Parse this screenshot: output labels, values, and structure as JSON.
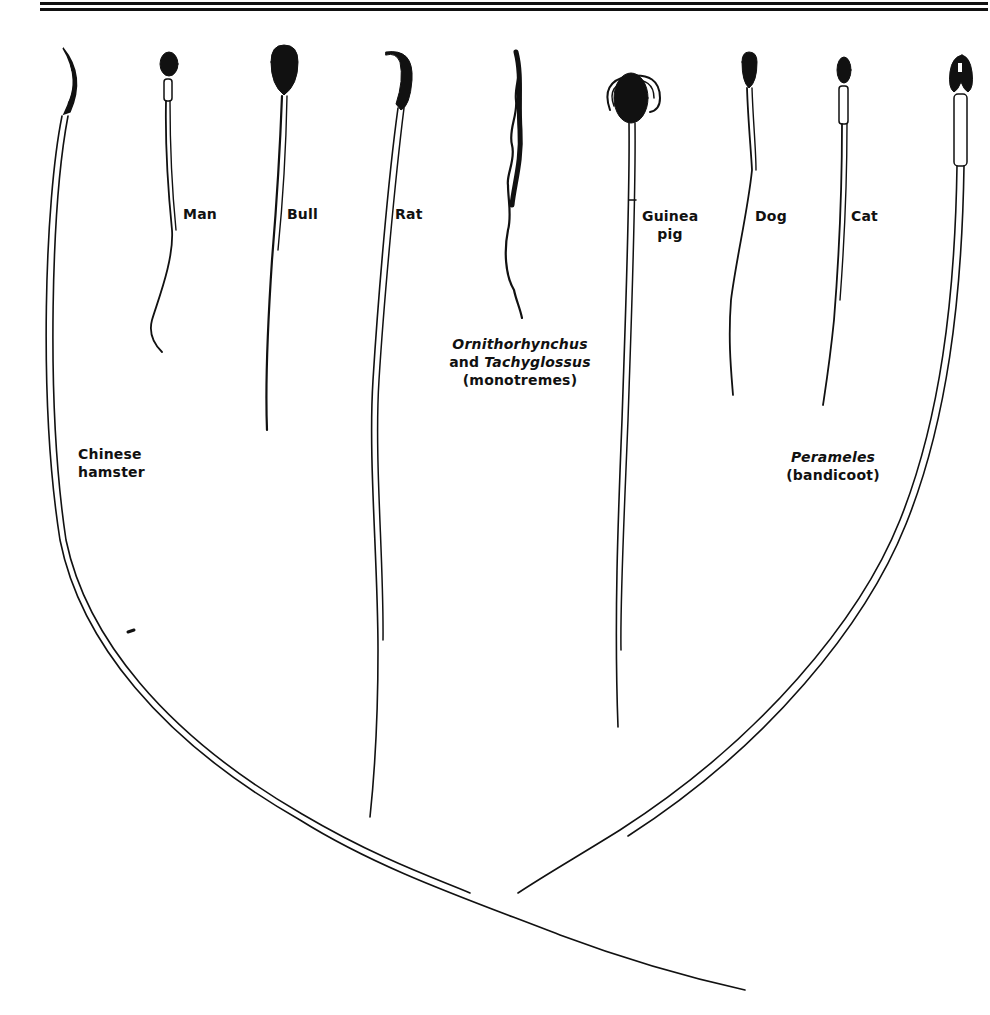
{
  "figure": {
    "type": "diagram",
    "colors": {
      "ink": "#111111",
      "background": "#ffffff"
    },
    "labels": {
      "chinese_hamster": {
        "line1": "Chinese",
        "line2": "hamster"
      },
      "man": "Man",
      "bull": "Bull",
      "rat": "Rat",
      "monotremes": {
        "line1_a": "Ornithorhynchus",
        "line2_a": "and ",
        "line2_b": "Tachyglossus",
        "line3": "(monotremes)"
      },
      "guinea_pig": {
        "line1": "Guinea",
        "line2": "pig"
      },
      "dog": "Dog",
      "cat": "Cat",
      "perameles": {
        "line1": "Perameles",
        "line2": "(bandicoot)"
      }
    },
    "specimens": [
      {
        "name": "Chinese hamster",
        "head": "hooked falciform",
        "tail": "very long, sweeping right"
      },
      {
        "name": "Man",
        "head": "small oval",
        "tail": "short"
      },
      {
        "name": "Bull",
        "head": "large paddle",
        "tail": "medium"
      },
      {
        "name": "Rat",
        "head": "hooked",
        "tail": "long"
      },
      {
        "name": "Ornithorhynchus and Tachyglossus (monotremes)",
        "head": "wavy filiform",
        "tail": "short wavy"
      },
      {
        "name": "Guinea pig",
        "head": "oval with large acrosome",
        "tail": "long"
      },
      {
        "name": "Dog",
        "head": "oval",
        "tail": "medium"
      },
      {
        "name": "Cat",
        "head": "small oval",
        "tail": "medium"
      },
      {
        "name": "Perameles (bandicoot)",
        "head": "notched",
        "tail": "very long, sweeping left"
      }
    ]
  }
}
